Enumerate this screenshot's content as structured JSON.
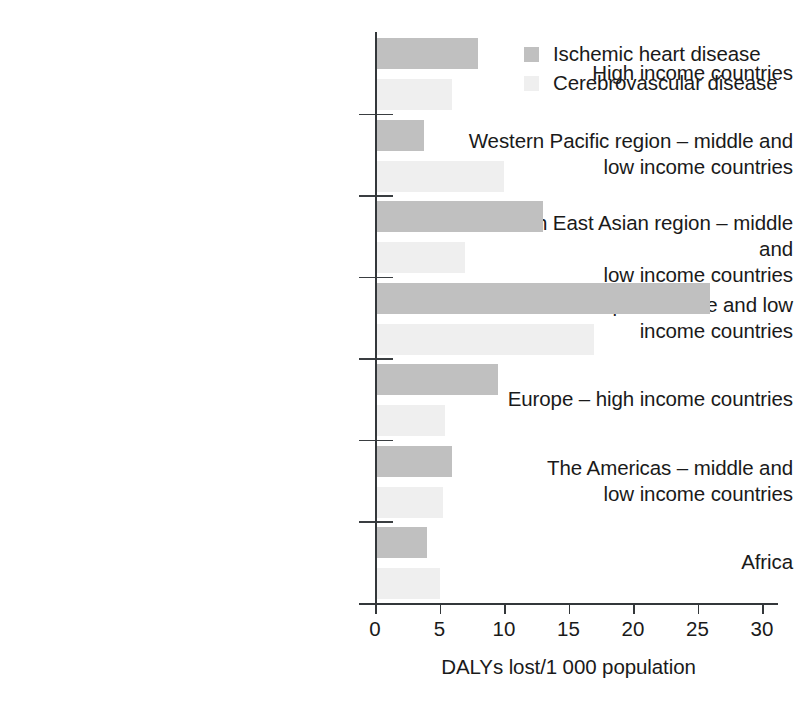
{
  "chart_data": {
    "type": "bar",
    "orientation": "horizontal",
    "title": "",
    "xlabel": "DALYs lost/1 000 population",
    "ylabel": "",
    "xlim": [
      0,
      30
    ],
    "xticks": [
      "0",
      "5",
      "10",
      "15",
      "20",
      "25",
      "30"
    ],
    "xtick_values": [
      0,
      5,
      10,
      15,
      20,
      25,
      30
    ],
    "grid": false,
    "legend_position": "top-right",
    "categories": [
      "High income countries",
      "Western Pacific region – middle and low income countries",
      "South East Asian region – middle and low income countries",
      "Europe – middle and low income countries",
      "Europe – high income countries",
      "The Americas – middle and low income countries",
      "Africa"
    ],
    "category_lines": [
      [
        "High income countries"
      ],
      [
        "Western Pacific region – middle and",
        "low income countries"
      ],
      [
        "South East Asian region – middle and",
        "low income countries"
      ],
      [
        "Europe – middle and low",
        "income countries"
      ],
      [
        "Europe – high income countries"
      ],
      [
        "The Americas – middle and",
        "low income countries"
      ],
      [
        "Africa"
      ]
    ],
    "series": [
      {
        "name": "Ischemic heart disease",
        "color": "#c0c0c0",
        "values": [
          8.0,
          3.8,
          13.0,
          26.0,
          9.5,
          6.0,
          4.0
        ]
      },
      {
        "name": "Cerebrovascular disease",
        "color": "#efefef",
        "values": [
          6.0,
          10.0,
          7.0,
          17.0,
          5.4,
          5.3,
          5.0
        ]
      }
    ]
  },
  "legend": {
    "items": [
      {
        "label": "Ischemic heart disease",
        "color": "#c0c0c0"
      },
      {
        "label": "Cerebrovascular disease",
        "color": "#efefef"
      }
    ]
  },
  "axis": {
    "x_title": "DALYs lost/1 000 population"
  }
}
